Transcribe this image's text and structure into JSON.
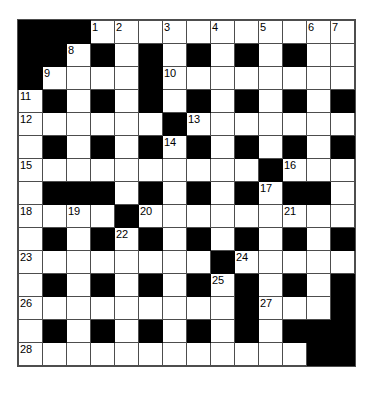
{
  "puzzle": {
    "type": "crossword-grid",
    "columns": 14,
    "rows": 15,
    "cell_size_px": 25,
    "colors": {
      "block": "#000000",
      "open": "#ffffff",
      "grid_line": "#4d4d4d",
      "number_text": "#000000"
    },
    "grid": [
      [
        "#",
        "#",
        "#",
        "1",
        "2",
        ".",
        "3",
        ".",
        "4",
        ".",
        "5",
        ".",
        "6",
        "7"
      ],
      [
        "#",
        "#",
        "8",
        "#",
        ".",
        "#",
        ".",
        "#",
        ".",
        "#",
        ".",
        "#",
        ".",
        "."
      ],
      [
        "#",
        "9",
        ".",
        ".",
        ".",
        "#",
        "10",
        ".",
        ".",
        ".",
        ".",
        ".",
        ".",
        "."
      ],
      [
        "11",
        "#",
        ".",
        "#",
        ".",
        "#",
        ".",
        "#",
        ".",
        "#",
        ".",
        "#",
        ".",
        "#"
      ],
      [
        "12",
        ".",
        ".",
        ".",
        ".",
        ".",
        "#",
        "13",
        ".",
        ".",
        ".",
        ".",
        ".",
        "."
      ],
      [
        ".",
        "#",
        ".",
        "#",
        ".",
        "#",
        "14",
        "#",
        ".",
        "#",
        ".",
        "#",
        ".",
        "#"
      ],
      [
        "15",
        ".",
        ".",
        ".",
        ".",
        ".",
        ".",
        ".",
        ".",
        ".",
        "#",
        "16",
        ".",
        "."
      ],
      [
        ".",
        "#",
        "#",
        "#",
        ".",
        "#",
        ".",
        "#",
        ".",
        "#",
        "17",
        "#",
        "#",
        "."
      ],
      [
        "18",
        ".",
        "19",
        ".",
        "#",
        "20",
        ".",
        ".",
        ".",
        ".",
        ".",
        "21",
        ".",
        "."
      ],
      [
        ".",
        "#",
        ".",
        "#",
        "22",
        "#",
        ".",
        "#",
        ".",
        "#",
        ".",
        "#",
        ".",
        "#"
      ],
      [
        "23",
        ".",
        ".",
        ".",
        ".",
        ".",
        ".",
        ".",
        "#",
        "24",
        ".",
        ".",
        ".",
        "."
      ],
      [
        ".",
        "#",
        ".",
        "#",
        ".",
        "#",
        ".",
        "#",
        "25",
        "#",
        ".",
        "#",
        ".",
        "#"
      ],
      [
        "26",
        ".",
        ".",
        ".",
        ".",
        ".",
        ".",
        ".",
        ".",
        "#",
        "27",
        ".",
        ".",
        "#"
      ],
      [
        ".",
        "#",
        ".",
        "#",
        ".",
        "#",
        ".",
        "#",
        ".",
        "#",
        ".",
        "#",
        "#",
        "#"
      ],
      [
        "28",
        ".",
        ".",
        ".",
        ".",
        ".",
        ".",
        ".",
        ".",
        ".",
        ".",
        ".",
        "#",
        "#"
      ]
    ],
    "clue_numbers": [
      1,
      2,
      3,
      4,
      5,
      6,
      7,
      8,
      9,
      10,
      11,
      12,
      13,
      14,
      15,
      16,
      17,
      18,
      19,
      20,
      21,
      22,
      23,
      24,
      25,
      26,
      27,
      28
    ]
  }
}
